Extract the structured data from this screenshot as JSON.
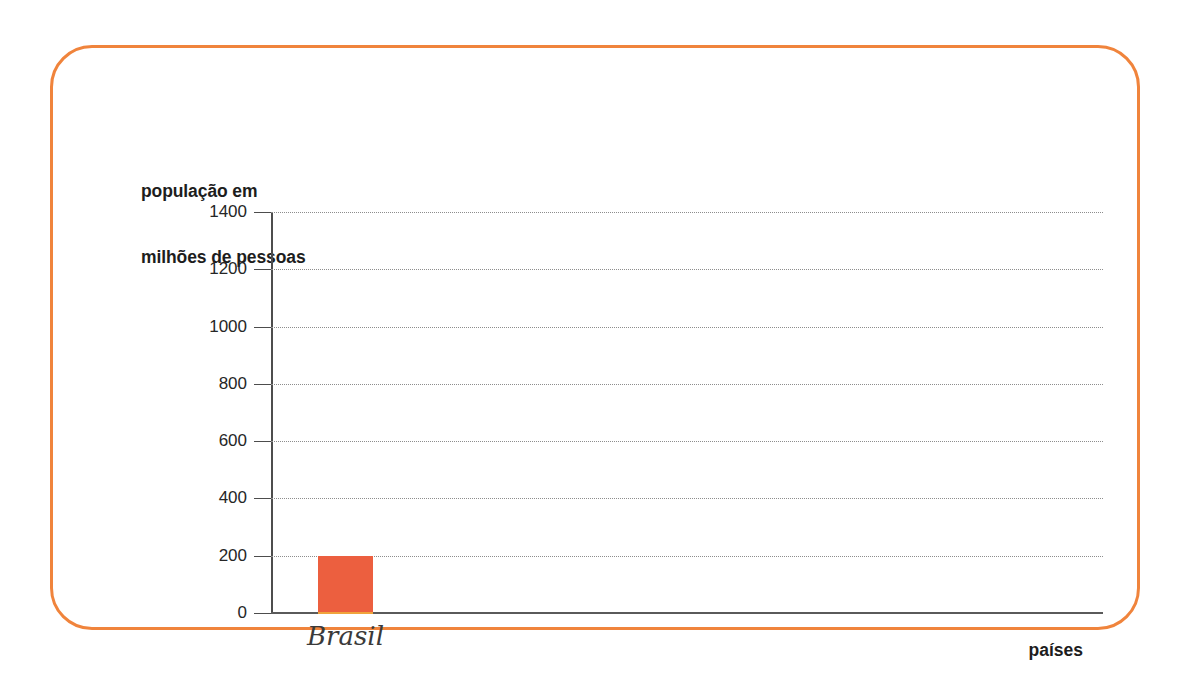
{
  "frame": {
    "border_color": "#f0843c",
    "background": "#ffffff"
  },
  "chart_data": {
    "type": "bar",
    "title": "",
    "ylabel_line1": "população em",
    "ylabel_line2": "milhões de pessoas",
    "ylabel": "população em milhões de pessoas",
    "xlabel": "países",
    "categories": [
      "Brasil"
    ],
    "values": [
      200
    ],
    "series": [
      {
        "name": "população",
        "values": [
          200
        ],
        "color": "#ec5f3f"
      }
    ],
    "ylim": [
      0,
      1400
    ],
    "yticks": [
      0,
      200,
      400,
      600,
      800,
      1000,
      1200,
      1400
    ],
    "ytick_labels": [
      "0",
      "200",
      "400",
      "600",
      "800",
      "1000",
      "1200",
      "1400"
    ],
    "grid": true,
    "grid_style": "dotted",
    "grid_color": "#8d8d8d",
    "legend": false,
    "legend_position": "none",
    "bar_color": "#ec5f3f",
    "axis_color": "#4d4d4d"
  }
}
